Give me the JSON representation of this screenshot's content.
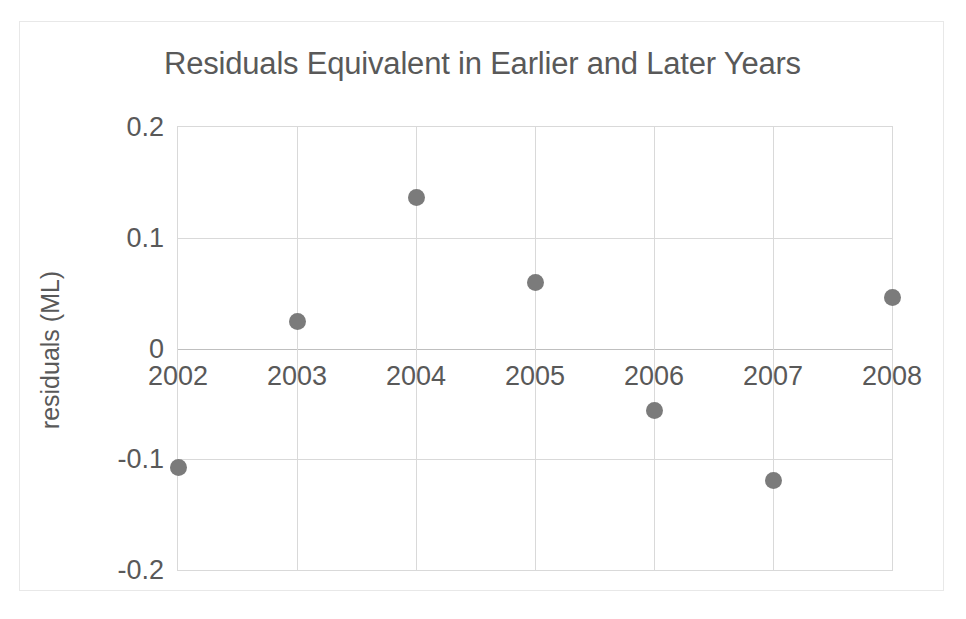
{
  "chart_data": {
    "type": "scatter",
    "title": "Residuals Equivalent in Earlier and Later Years",
    "xlabel": "",
    "ylabel": "residuals (ML)",
    "x": [
      2002,
      2003,
      2004,
      2005,
      2006,
      2007,
      2008
    ],
    "values": [
      -0.107,
      0.024,
      0.136,
      0.06,
      -0.056,
      -0.119,
      0.046
    ],
    "series": [
      {
        "name": "residuals",
        "values": [
          -0.107,
          0.024,
          0.136,
          0.06,
          -0.056,
          -0.119,
          0.046
        ]
      }
    ],
    "xlim": [
      2002,
      2008
    ],
    "ylim": [
      -0.2,
      0.2
    ],
    "x_tick_labels": [
      "2002",
      "2003",
      "2004",
      "2005",
      "2006",
      "2007",
      "2008"
    ],
    "y_tick_labels": [
      "0.2",
      "0.1",
      "0",
      "-0.1",
      "-0.2"
    ],
    "y_ticks": [
      0.2,
      0.1,
      0,
      -0.1,
      -0.2
    ],
    "grid": true,
    "legend": "none",
    "marker_color": "#7b7b7b",
    "gridline_color": "#d9d9d9",
    "text_color": "#595959",
    "background_color": "#ffffff"
  }
}
